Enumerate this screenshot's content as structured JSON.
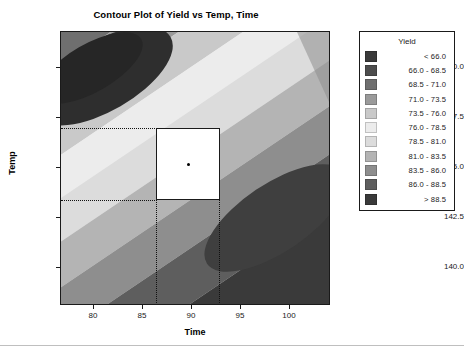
{
  "chart_data": {
    "type": "contour",
    "title": "Contour Plot of Yield vs Temp, Time",
    "xlabel": "Time",
    "ylabel": "Temp",
    "xlim": [
      76.5,
      103.8
    ],
    "ylim": [
      138.2,
      151.8
    ],
    "xticks": [
      "80",
      "85",
      "90",
      "95",
      "100"
    ],
    "xtick_values": [
      80,
      85,
      90,
      95,
      100
    ],
    "yticks": [
      "150.0",
      "147.5",
      "145.0",
      "142.5",
      "140.0"
    ],
    "ytick_values": [
      150.0,
      147.5,
      145.0,
      142.5,
      140.0
    ],
    "zvar": "Yield",
    "levels": [
      66.0,
      68.5,
      71.0,
      73.5,
      76.0,
      78.5,
      81.0,
      83.5,
      86.0,
      88.5
    ],
    "grid": false,
    "legend_position": "right",
    "annotations": {
      "design_rectangle": {
        "x_range": [
          86.2,
          92.8
        ],
        "y_range": [
          142.9,
          146.7
        ],
        "fill": "#ffffff",
        "border": "#1a1a1a"
      },
      "center_point": {
        "x": 89.5,
        "y": 144.8
      },
      "reference_lines": {
        "horizontal_y": [
          146.7,
          142.9
        ],
        "vertical_x": [
          86.2,
          92.8
        ],
        "style": "dotted"
      }
    },
    "band_colors": [
      "#3a3a3a",
      "#4d4d4d",
      "#6f6f6f",
      "#9a9a9a",
      "#c9c9c9",
      "#ececec",
      "#dcdcdc",
      "#b4b4b4",
      "#8e8e8e",
      "#5e5e5e",
      "#3a3a3a"
    ]
  },
  "chart": {
    "title": "Contour Plot of Yield vs Temp, Time",
    "x_axis_title": "Time",
    "y_axis_title": "Temp",
    "y_ticks": [
      {
        "label": "150.0",
        "top": 67
      },
      {
        "label": "147.5",
        "top": 117
      },
      {
        "label": "145.0",
        "top": 167
      },
      {
        "label": "142.5",
        "top": 217
      },
      {
        "label": "140.0",
        "top": 267
      }
    ],
    "x_ticks": [
      {
        "label": "80",
        "left": 93
      },
      {
        "label": "85",
        "left": 142
      },
      {
        "label": "90",
        "left": 191
      },
      {
        "label": "95",
        "left": 240
      },
      {
        "label": "100",
        "left": 289
      }
    ]
  },
  "legend": {
    "title": "Yield",
    "items": [
      {
        "label": "<   66.0",
        "color": "#3a3a3a"
      },
      {
        "label": "66.0 -  68.5",
        "color": "#4d4d4d"
      },
      {
        "label": "68.5 -  71.0",
        "color": "#6f6f6f"
      },
      {
        "label": "71.0 -  73.5",
        "color": "#9a9a9a"
      },
      {
        "label": "73.5 -  76.0",
        "color": "#c9c9c9"
      },
      {
        "label": "76.0 -  78.5",
        "color": "#ececec"
      },
      {
        "label": "78.5 -  81.0",
        "color": "#dcdcdc"
      },
      {
        "label": "81.0 -  83.5",
        "color": "#b4b4b4"
      },
      {
        "label": "83.5 -  86.0",
        "color": "#8e8e8e"
      },
      {
        "label": "86.0 -  88.5",
        "color": "#5e5e5e"
      },
      {
        "label": ">   88.5",
        "color": "#3a3a3a"
      }
    ]
  }
}
